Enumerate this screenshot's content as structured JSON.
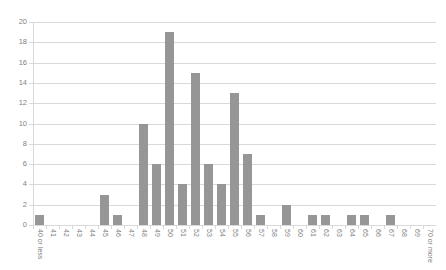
{
  "chart": {
    "title": "",
    "bar_color": "#969696",
    "gridline_color": "#d9d9d9",
    "label_color": "#7f7f7f"
  },
  "chart_data": {
    "type": "bar",
    "title": "",
    "xlabel": "",
    "ylabel": "",
    "ylim": [
      0,
      20
    ],
    "ytick_step": 2,
    "yticks": [
      "0",
      "2",
      "4",
      "6",
      "8",
      "10",
      "12",
      "14",
      "16",
      "18",
      "20"
    ],
    "grid": true,
    "legend": "none",
    "categories": [
      "40 or less",
      "41",
      "42",
      "43",
      "44",
      "45",
      "46",
      "47",
      "48",
      "49",
      "50",
      "51",
      "52",
      "53",
      "54",
      "55",
      "56",
      "57",
      "58",
      "59",
      "60",
      "61",
      "62",
      "63",
      "64",
      "65",
      "66",
      "67",
      "68",
      "69",
      "70 or more"
    ],
    "values": [
      1,
      0,
      0,
      0,
      0,
      3,
      1,
      0,
      10,
      6,
      19,
      4,
      15,
      6,
      4,
      13,
      7,
      1,
      0,
      2,
      0,
      1,
      1,
      0,
      1,
      1,
      0,
      1,
      0,
      0,
      0
    ]
  }
}
